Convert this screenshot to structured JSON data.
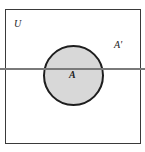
{
  "diagram": {
    "type": "venn",
    "universe": {
      "label": "U"
    },
    "sets": [
      {
        "name": "A",
        "label": "A",
        "fill": "#d8d8d8",
        "stroke": "#1e1e1e"
      }
    ],
    "complement": {
      "label": "A'"
    },
    "line": {
      "color": "#7a7a7a",
      "orientation": "horizontal"
    },
    "colors": {
      "background": "#ffffff",
      "box_border": "#3a3a3a",
      "set_fill": "#d8d8d8"
    }
  }
}
